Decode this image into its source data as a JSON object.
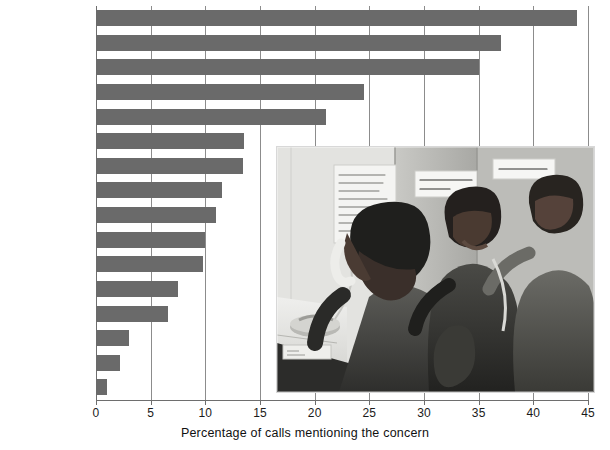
{
  "chart_data": {
    "type": "bar",
    "orientation": "horizontal",
    "title": "",
    "xlabel": "Percentage of calls mentioning the concern",
    "ylabel": "",
    "xlim": [
      0,
      45
    ],
    "xticks": [
      0,
      5,
      10,
      15,
      20,
      25,
      30,
      35,
      40,
      45
    ],
    "grid": true,
    "legend": null,
    "bar_color": "#6a6a6a",
    "categories": [
      "Family problems",
      "Peer relationships",
      "Self-esteem",
      "Just to talk",
      "Drugs and alcohol",
      "Abuse",
      "Sexuality",
      "School problems",
      "Death",
      "Mental illness",
      "Spirituality",
      "Pregnancy",
      "Other",
      "Legal issue",
      "Eating disorder",
      "AIDS"
    ],
    "values": [
      44.0,
      37.0,
      35.0,
      24.5,
      21.0,
      13.5,
      13.4,
      11.5,
      11.0,
      10.0,
      9.8,
      7.5,
      6.6,
      3.0,
      2.2,
      1.0
    ]
  },
  "inset": {
    "name": "helpline-photo",
    "description": "Black and white photograph of teenagers answering phones at a youth helpline call centre",
    "wall_notes": [
      "Please join you\nlisten are some\nhear them you;\nAnd they have change\nhave found your help\nThe caller",
      "LISTEN WITH CARE\nSAVE A LIFE!",
      "CRISIS HOT LINE"
    ]
  }
}
